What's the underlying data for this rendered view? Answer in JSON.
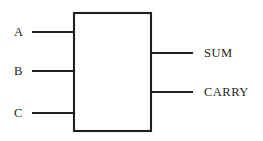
{
  "diagram": {
    "type": "block-diagram",
    "background_color": "#ffffff",
    "line_color": "#231f20",
    "block": {
      "name": "adder-block",
      "label": "",
      "fill_color": "#ffffff",
      "x": 74,
      "y": 13,
      "width": 77,
      "height": 118
    },
    "inputs": [
      {
        "label": "A",
        "wire_y": 32,
        "wire_x1": 32,
        "wire_x2": 75,
        "label_x": 14,
        "label_y": 26
      },
      {
        "label": "B",
        "wire_y": 71,
        "wire_x1": 32,
        "wire_x2": 75,
        "label_x": 14,
        "label_y": 65
      },
      {
        "label": "C",
        "wire_y": 113,
        "wire_x1": 32,
        "wire_x2": 75,
        "label_x": 14,
        "label_y": 107
      }
    ],
    "outputs": [
      {
        "label": "SUM",
        "wire_y": 53,
        "wire_x1": 150,
        "wire_x2": 193,
        "label_x": 204,
        "label_y": 47
      },
      {
        "label": "CARRY",
        "wire_y": 92,
        "wire_x1": 150,
        "wire_x2": 193,
        "label_x": 204,
        "label_y": 86
      }
    ]
  }
}
